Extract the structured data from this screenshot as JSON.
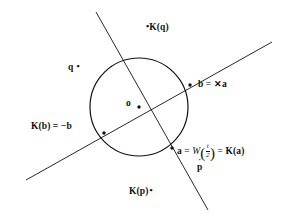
{
  "figure": {
    "background_color": "#ffffff",
    "stroke_color": "#111111",
    "width": 284,
    "height": 223
  },
  "geometry": {
    "circle": {
      "cx": 139,
      "cy": 107,
      "r": 49
    },
    "center_point": {
      "x": 139,
      "y": 107,
      "label": "o"
    },
    "lines": [
      {
        "name": "rising-secant",
        "x1": 26,
        "y1": 180,
        "x2": 272,
        "y2": 42
      },
      {
        "name": "steep-secant",
        "x1": 96,
        "y1": 12,
        "x2": 208,
        "y2": 210
      }
    ],
    "points": [
      {
        "name": "point-b",
        "x": 190,
        "y": 85
      },
      {
        "name": "point-Kb",
        "x": 104,
        "y": 133
      },
      {
        "name": "point-a",
        "x": 172,
        "y": 148
      },
      {
        "name": "point-o",
        "x": 139,
        "y": 107
      }
    ],
    "marker_dots": [
      {
        "name": "dot-Kq",
        "x": 150,
        "y": 27
      },
      {
        "name": "dot-q",
        "x": 84,
        "y": 67
      },
      {
        "name": "dot-pdot",
        "x": 201,
        "y": 164
      },
      {
        "name": "dot-Kp",
        "x": 163,
        "y": 191
      }
    ]
  },
  "labels": {
    "Kq": {
      "dot": "•",
      "text": "K(q)"
    },
    "q": {
      "text": "q",
      "dot": "•"
    },
    "b": {
      "lhs": "b",
      "eq": " = ",
      "operator": "✕",
      "rhs": "a"
    },
    "Kb": {
      "text": "K(b) = −b"
    },
    "a": {
      "lhs": "a",
      "eq1": " = ",
      "func": "W",
      "open_paren": "(",
      "numerator": "t",
      "denominator": "2",
      "close_paren": ")",
      "eq2": " = ",
      "rhs": "K(a)"
    },
    "pdot": {
      "letter": "p",
      "accent": "˙"
    },
    "Kp": {
      "text": "K(p)",
      "dot": "•"
    },
    "o": {
      "text": "o"
    }
  }
}
